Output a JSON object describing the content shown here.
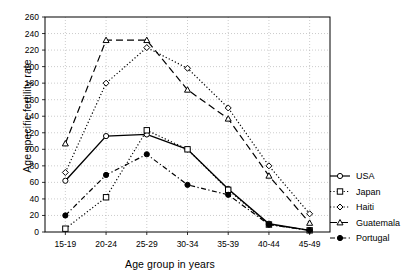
{
  "chart_data": {
    "type": "line",
    "title": "",
    "xlabel": "Age group in years",
    "ylabel": "Age specific fertility rate",
    "categories": [
      "15-19",
      "20-24",
      "25-29",
      "30-34",
      "35-39",
      "40-44",
      "45-49"
    ],
    "ylim": [
      0,
      260
    ],
    "ytick_step": 20,
    "yticks": [
      0,
      20,
      40,
      60,
      80,
      100,
      120,
      140,
      160,
      180,
      200,
      220,
      240,
      260
    ],
    "grid": true,
    "legend_position": "right",
    "series": [
      {
        "name": "USA",
        "marker": "open-circle",
        "line": "solid",
        "color": "#000000",
        "values": [
          62,
          116,
          118,
          100,
          52,
          10,
          2
        ]
      },
      {
        "name": "Japan",
        "marker": "open-square",
        "line": "dotted",
        "color": "#000000",
        "values": [
          4,
          42,
          123,
          100,
          51,
          9,
          2
        ]
      },
      {
        "name": "Haiti",
        "marker": "open-diamond",
        "line": "dotted",
        "color": "#000000",
        "values": [
          72,
          180,
          223,
          198,
          150,
          80,
          22
        ]
      },
      {
        "name": "Guatemala",
        "marker": "open-triangle",
        "line": "dashed",
        "color": "#000000",
        "values": [
          107,
          232,
          232,
          172,
          137,
          68,
          11
        ]
      },
      {
        "name": "Portugal",
        "marker": "filled-circle",
        "line": "dash-dot",
        "color": "#000000",
        "values": [
          20,
          69,
          94,
          57,
          45,
          9,
          2
        ]
      }
    ]
  },
  "legend": {
    "entries": [
      {
        "label": "USA"
      },
      {
        "label": "Japan"
      },
      {
        "label": "Haiti"
      },
      {
        "label": "Guatemala"
      },
      {
        "label": "Portugal"
      }
    ]
  }
}
